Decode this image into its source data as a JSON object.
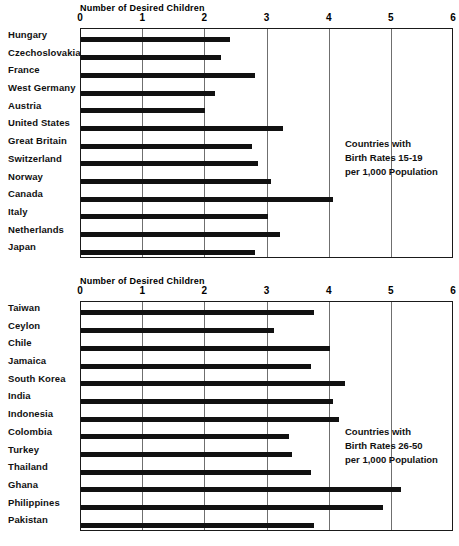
{
  "chart_data": [
    {
      "type": "bar",
      "orientation": "horizontal",
      "title": "",
      "xlabel": "Number of Desired Children",
      "ylabel": "",
      "xlim": [
        0,
        6
      ],
      "xticks": [
        "0",
        "1",
        "2",
        "3",
        "4",
        "5",
        "6"
      ],
      "grid": true,
      "annotation": [
        "Countries with",
        "Birth Rates 15-19",
        "per 1,000 Population"
      ],
      "categories": [
        "Hungary",
        "Czechoslovakia",
        "France",
        "West Germany",
        "Austria",
        "United States",
        "Great Britain",
        "Switzerland",
        "Norway",
        "Canada",
        "Italy",
        "Netherlands",
        "Japan"
      ],
      "values": [
        2.4,
        2.25,
        2.8,
        2.15,
        2.0,
        3.25,
        2.75,
        2.85,
        3.05,
        4.05,
        3.0,
        3.2,
        2.8
      ]
    },
    {
      "type": "bar",
      "orientation": "horizontal",
      "title": "",
      "xlabel": "Number of Desired Children",
      "ylabel": "",
      "xlim": [
        0,
        6
      ],
      "xticks": [
        "0",
        "1",
        "2",
        "3",
        "4",
        "5",
        "6"
      ],
      "grid": true,
      "annotation": [
        "Countries with",
        "Birth Rates 26-50",
        "per 1,000 Population"
      ],
      "categories": [
        "Taiwan",
        "Ceylon",
        "Chile",
        "Jamaica",
        "South Korea",
        "India",
        "Indonesia",
        "Colombia",
        "Turkey",
        "Thailand",
        "Ghana",
        "Philippines",
        "Pakistan"
      ],
      "values": [
        3.75,
        3.1,
        4.0,
        3.7,
        4.25,
        4.05,
        4.15,
        3.35,
        3.4,
        3.7,
        5.15,
        4.85,
        3.75
      ]
    }
  ],
  "style": {
    "bar_color": "#111111",
    "grid_color": "#6f6f6f",
    "axis_color": "#1a1a1a",
    "background": "#ffffff"
  }
}
